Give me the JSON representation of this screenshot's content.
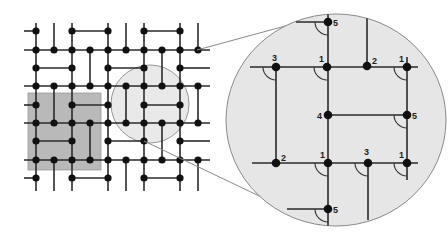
{
  "diagram": {
    "colors": {
      "background": "#ffffff",
      "edge": "#2a2a2a",
      "node": "#111111",
      "highlight_square": "#b9b9b9",
      "magnifier_fill": "#e6e6e6",
      "magnifier_stroke": "#8a8a8a"
    },
    "grid": {
      "columns_x": [
        36,
        54,
        72,
        90,
        108,
        126,
        144,
        162,
        180,
        198
      ],
      "rows_y": [
        31,
        50,
        68,
        86,
        105,
        123,
        141,
        160,
        178
      ],
      "horizontal_lines": [
        {
          "y": 50,
          "x1": 24,
          "x2": 210
        },
        {
          "y": 86,
          "x1": 24,
          "x2": 210
        },
        {
          "y": 123,
          "x1": 24,
          "x2": 210
        },
        {
          "y": 160,
          "x1": 24,
          "x2": 210
        }
      ],
      "horizontal_segments": [
        {
          "y": 31,
          "x1": 24,
          "x2": 36
        },
        {
          "y": 31,
          "x1": 72,
          "x2": 108
        },
        {
          "y": 31,
          "x1": 144,
          "x2": 180
        },
        {
          "y": 68,
          "x1": 36,
          "x2": 72
        },
        {
          "y": 68,
          "x1": 108,
          "x2": 144
        },
        {
          "y": 68,
          "x1": 180,
          "x2": 210
        },
        {
          "y": 105,
          "x1": 24,
          "x2": 36
        },
        {
          "y": 105,
          "x1": 72,
          "x2": 108
        },
        {
          "y": 105,
          "x1": 144,
          "x2": 180
        },
        {
          "y": 141,
          "x1": 36,
          "x2": 72
        },
        {
          "y": 141,
          "x1": 108,
          "x2": 144
        },
        {
          "y": 141,
          "x1": 180,
          "x2": 210
        },
        {
          "y": 178,
          "x1": 24,
          "x2": 36
        },
        {
          "y": 178,
          "x1": 72,
          "x2": 108
        },
        {
          "y": 178,
          "x1": 144,
          "x2": 180
        }
      ],
      "vertical_lines": [
        {
          "x": 36,
          "y1": 23,
          "y2": 191
        },
        {
          "x": 72,
          "y1": 23,
          "y2": 191
        },
        {
          "x": 108,
          "y1": 23,
          "y2": 191
        },
        {
          "x": 144,
          "y1": 23,
          "y2": 191
        },
        {
          "x": 180,
          "y1": 23,
          "y2": 191
        }
      ],
      "vertical_segments": [
        {
          "x": 54,
          "y1": 23,
          "y2": 50
        },
        {
          "x": 54,
          "y1": 86,
          "y2": 123
        },
        {
          "x": 54,
          "y1": 160,
          "y2": 191
        },
        {
          "x": 90,
          "y1": 50,
          "y2": 86
        },
        {
          "x": 90,
          "y1": 123,
          "y2": 160
        },
        {
          "x": 126,
          "y1": 23,
          "y2": 50
        },
        {
          "x": 126,
          "y1": 86,
          "y2": 123
        },
        {
          "x": 126,
          "y1": 160,
          "y2": 191
        },
        {
          "x": 162,
          "y1": 50,
          "y2": 86
        },
        {
          "x": 162,
          "y1": 123,
          "y2": 160
        },
        {
          "x": 198,
          "y1": 23,
          "y2": 50
        },
        {
          "x": 198,
          "y1": 86,
          "y2": 123
        },
        {
          "x": 198,
          "y1": 160,
          "y2": 191
        }
      ],
      "nodes": [
        [
          36,
          31
        ],
        [
          72,
          31
        ],
        [
          108,
          31
        ],
        [
          144,
          31
        ],
        [
          180,
          31
        ],
        [
          36,
          50
        ],
        [
          54,
          50
        ],
        [
          72,
          50
        ],
        [
          90,
          50
        ],
        [
          108,
          50
        ],
        [
          126,
          50
        ],
        [
          144,
          50
        ],
        [
          162,
          50
        ],
        [
          180,
          50
        ],
        [
          198,
          50
        ],
        [
          36,
          68
        ],
        [
          72,
          68
        ],
        [
          108,
          68
        ],
        [
          144,
          68
        ],
        [
          180,
          68
        ],
        [
          36,
          86
        ],
        [
          54,
          86
        ],
        [
          72,
          86
        ],
        [
          90,
          86
        ],
        [
          108,
          86
        ],
        [
          126,
          86
        ],
        [
          144,
          86
        ],
        [
          162,
          86
        ],
        [
          180,
          86
        ],
        [
          198,
          86
        ],
        [
          36,
          105
        ],
        [
          72,
          105
        ],
        [
          108,
          105
        ],
        [
          144,
          105
        ],
        [
          180,
          105
        ],
        [
          36,
          123
        ],
        [
          54,
          123
        ],
        [
          72,
          123
        ],
        [
          90,
          123
        ],
        [
          108,
          123
        ],
        [
          126,
          123
        ],
        [
          144,
          123
        ],
        [
          162,
          123
        ],
        [
          180,
          123
        ],
        [
          198,
          123
        ],
        [
          36,
          141
        ],
        [
          72,
          141
        ],
        [
          108,
          141
        ],
        [
          144,
          141
        ],
        [
          180,
          141
        ],
        [
          36,
          160
        ],
        [
          54,
          160
        ],
        [
          72,
          160
        ],
        [
          90,
          160
        ],
        [
          108,
          160
        ],
        [
          126,
          160
        ],
        [
          144,
          160
        ],
        [
          162,
          160
        ],
        [
          180,
          160
        ],
        [
          198,
          160
        ],
        [
          36,
          178
        ],
        [
          72,
          178
        ],
        [
          108,
          178
        ],
        [
          144,
          178
        ],
        [
          180,
          178
        ]
      ]
    },
    "highlight_square": {
      "x": 28,
      "y": 93,
      "width": 73,
      "height": 77
    },
    "small_circle": {
      "cx": 150,
      "cy": 104,
      "r": 39
    },
    "magnifier_lines": [
      {
        "x1": 197,
        "y1": 50,
        "x2": 322,
        "y2": 16
      },
      {
        "x1": 144,
        "y1": 141,
        "x2": 320,
        "y2": 225
      }
    ],
    "magnifier": {
      "cx": 336,
      "cy": 120,
      "rx": 110,
      "ry": 106,
      "edges": [
        {
          "x1": 328,
          "y1": 14,
          "x2": 328,
          "y2": 226
        },
        {
          "x1": 296,
          "y1": 22,
          "x2": 328,
          "y2": 22
        },
        {
          "x1": 367,
          "y1": 18,
          "x2": 367,
          "y2": 66
        },
        {
          "x1": 250,
          "y1": 67,
          "x2": 418,
          "y2": 67
        },
        {
          "x1": 276,
          "y1": 67,
          "x2": 276,
          "y2": 163
        },
        {
          "x1": 407,
          "y1": 57,
          "x2": 407,
          "y2": 180
        },
        {
          "x1": 328,
          "y1": 115,
          "x2": 407,
          "y2": 115
        },
        {
          "x1": 252,
          "y1": 163,
          "x2": 418,
          "y2": 163
        },
        {
          "x1": 368,
          "y1": 163,
          "x2": 368,
          "y2": 220
        },
        {
          "x1": 287,
          "y1": 209,
          "x2": 328,
          "y2": 209
        }
      ],
      "nodes": [
        {
          "x": 328,
          "y": 22,
          "label": "5",
          "lx": 333,
          "ly": 26
        },
        {
          "x": 276,
          "y": 67,
          "label": "3",
          "lx": 272,
          "ly": 61
        },
        {
          "x": 327,
          "y": 67,
          "label": "1",
          "lx": 319,
          "ly": 62
        },
        {
          "x": 367,
          "y": 66,
          "label": "2",
          "lx": 372,
          "ly": 64
        },
        {
          "x": 407,
          "y": 67,
          "label": "1",
          "lx": 399,
          "ly": 62
        },
        {
          "x": 328,
          "y": 115,
          "label": "4",
          "lx": 317,
          "ly": 119
        },
        {
          "x": 407,
          "y": 115,
          "label": "5",
          "lx": 412,
          "ly": 119
        },
        {
          "x": 276,
          "y": 163,
          "label": "2",
          "lx": 281,
          "ly": 161
        },
        {
          "x": 328,
          "y": 163,
          "label": "1",
          "lx": 320,
          "ly": 158
        },
        {
          "x": 368,
          "y": 163,
          "label": "3",
          "lx": 364,
          "ly": 155
        },
        {
          "x": 407,
          "y": 163,
          "label": "1",
          "lx": 399,
          "ly": 158
        },
        {
          "x": 328,
          "y": 209,
          "label": "5",
          "lx": 333,
          "ly": 213
        }
      ],
      "angle_arcs": [
        {
          "cx": 328,
          "cy": 22,
          "dir": "down-left"
        },
        {
          "cx": 276,
          "cy": 67,
          "dir": "down-left"
        },
        {
          "cx": 327,
          "cy": 67,
          "dir": "down-left"
        },
        {
          "cx": 407,
          "cy": 67,
          "dir": "down-left"
        },
        {
          "cx": 407,
          "cy": 115,
          "dir": "down-left"
        },
        {
          "cx": 328,
          "cy": 163,
          "dir": "down-left"
        },
        {
          "cx": 368,
          "cy": 163,
          "dir": "down-left"
        },
        {
          "cx": 407,
          "cy": 163,
          "dir": "down-left"
        },
        {
          "cx": 328,
          "cy": 209,
          "dir": "down-left"
        }
      ]
    }
  }
}
